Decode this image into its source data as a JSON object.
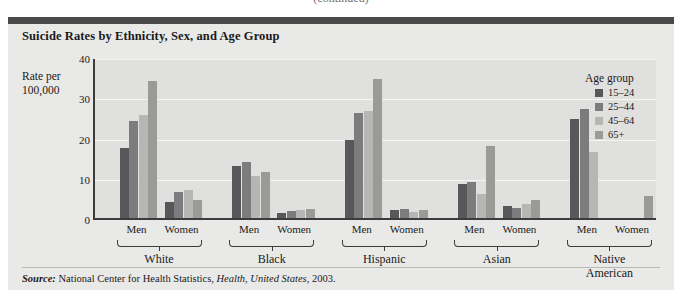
{
  "page_header_clipped": "(continued)",
  "figure": {
    "title": "Suicide Rates by Ethnicity, Sex, and Age Group",
    "axis_title_line1": "Rate per",
    "axis_title_line2": "100,000",
    "source_prefix": "Source:",
    "source_text_1": " National Center for Health Statistics, ",
    "source_italic": "Health, United States",
    "source_text_2": ", 2003."
  },
  "legend": {
    "title": "Age group",
    "items": [
      {
        "label": "15–24",
        "color": "#58585a"
      },
      {
        "label": "25–44",
        "color": "#7c7c7e"
      },
      {
        "label": "45–64",
        "color": "#b6b6b4"
      },
      {
        "label": "65+",
        "color": "#9a9a98"
      }
    ]
  },
  "chart_data": {
    "type": "bar",
    "title": "Suicide Rates by Ethnicity, Sex, and Age Group",
    "xlabel": "",
    "ylabel": "Rate per 100,000",
    "ylim": [
      0,
      40
    ],
    "yticks": [
      0,
      10,
      20,
      30,
      40
    ],
    "grid": true,
    "legend_position": "right",
    "legend_title": "Age group",
    "ethnicities": [
      "White",
      "Black",
      "Hispanic",
      "Asian",
      "Native\nAmerican"
    ],
    "sexes": [
      "Men",
      "Women"
    ],
    "categories": [
      "White Men",
      "White Women",
      "Black Men",
      "Black Women",
      "Hispanic Men",
      "Hispanic Women",
      "Asian Men",
      "Asian Women",
      "Native American Men",
      "Native American Women"
    ],
    "series": [
      {
        "name": "15–24",
        "color": "#58585a",
        "values": [
          17.5,
          4.0,
          13.0,
          1.2,
          19.5,
          2.0,
          8.5,
          3.0,
          24.5,
          null
        ]
      },
      {
        "name": "25–44",
        "color": "#7c7c7e",
        "values": [
          24.0,
          6.5,
          14.0,
          1.8,
          26.0,
          2.2,
          9.0,
          2.5,
          27.0,
          null
        ]
      },
      {
        "name": "45–64",
        "color": "#b6b6b4",
        "values": [
          25.5,
          7.0,
          10.5,
          2.0,
          26.5,
          1.5,
          6.0,
          3.5,
          16.5,
          null
        ]
      },
      {
        "name": "65+",
        "color": "#9a9a98",
        "values": [
          34.0,
          4.5,
          11.5,
          2.2,
          34.5,
          2.0,
          18.0,
          4.5,
          null,
          5.5
        ]
      }
    ]
  }
}
